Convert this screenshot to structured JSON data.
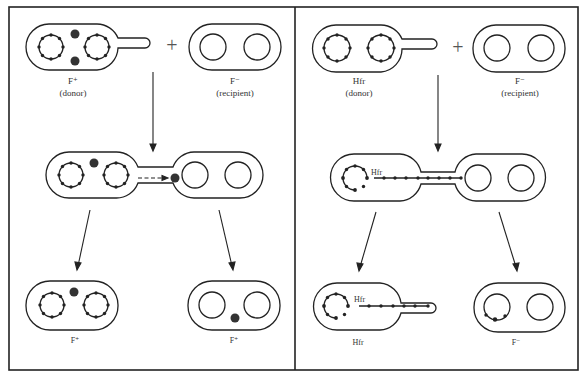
{
  "figure": {
    "colors": {
      "line": "#222222",
      "background": "#ffffff",
      "plasmid": "#333333"
    }
  },
  "left_panel": {
    "name": "F+ x F- cross",
    "top": {
      "donor": {
        "label": "F⁺",
        "sublabel": "(donor)"
      },
      "plus": "+",
      "recipient": {
        "label": "F⁻",
        "sublabel": "(recipient)"
      }
    },
    "middle": {
      "description": "F plasmid transferred through pilus (dashed arrow)"
    },
    "bottom": {
      "left_cell": {
        "label": "F⁺"
      },
      "right_cell": {
        "label": "F⁺"
      }
    }
  },
  "right_panel": {
    "name": "Hfr x F- cross",
    "top": {
      "donor": {
        "label": "Hfr",
        "sublabel": "(donor)"
      },
      "plus": "+",
      "recipient": {
        "label": "F⁻",
        "sublabel": "(recipient)"
      }
    },
    "middle": {
      "chromosome_label": "Hfr"
    },
    "bottom": {
      "left_cell": {
        "label": "Hfr",
        "chromosome_label": "Hfr"
      },
      "right_cell": {
        "label": "F⁻"
      }
    }
  }
}
